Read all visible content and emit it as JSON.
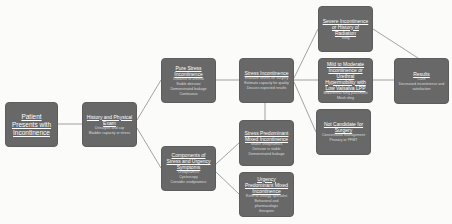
{
  "diagram": {
    "colors": {
      "background": "#fbfbfa",
      "node_fill": "#686868",
      "node_text": "#ffffff",
      "connector": "#8c8c8c"
    },
    "nodes": [
      {
        "id": "presents",
        "title": "Patient Presents with Incontinence",
        "lines": []
      },
      {
        "id": "history",
        "title": "History and Physical Exam",
        "lines": [
          "Urinalysis and cap",
          "Bladder capacity or stress"
        ]
      },
      {
        "id": "pure_stress",
        "title": "Pure Stress Incontinence",
        "lines": [
          "Distance to urethra",
          "Stable detrusor",
          "Demonstrated leakage",
          "Continuous"
        ]
      },
      {
        "id": "components",
        "title": "Components of Stress and Urgency Symptoms",
        "lines": [
          "Urodynamics",
          "Cystoscopy",
          "Consider urodynamics"
        ]
      },
      {
        "id": "stress_inc",
        "title": "Stress Incontinence",
        "lines": [
          "Evaluate fitness for surgery",
          "Estimate capacity for quality",
          "Discuss expected results"
        ]
      },
      {
        "id": "stress_mixed",
        "title": "Stress Predominant Mixed Incontinence",
        "lines": [
          "Stable urodynamics",
          "Detrusor is stable",
          "Demonstrated leakage"
        ]
      },
      {
        "id": "urgency_mixed",
        "title": "Urgency Predominant Mixed Incontinence",
        "lines": [
          "Refer to urology specialist",
          "Behavioral and pharmacologic",
          "therapies"
        ]
      },
      {
        "id": "severe",
        "title": "Severe Incontinence or History of Radiation",
        "lines": [
          "Sling"
        ]
      },
      {
        "id": "mild_mod",
        "title": "Mild to Moderate Incontinence or Urethral Hypermobility with Low Valsalva LPP",
        "lines": [
          "Midurethral sling placement",
          "Mesh sling"
        ]
      },
      {
        "id": "not_candidate",
        "title": "Not Candidate for Surgery",
        "lines": [
          "Conservative management",
          "Pessary or PFMT"
        ]
      },
      {
        "id": "results",
        "title": "Results",
        "lines": [
          "Cure",
          "Decreased incontinence and satisfaction"
        ]
      }
    ]
  }
}
